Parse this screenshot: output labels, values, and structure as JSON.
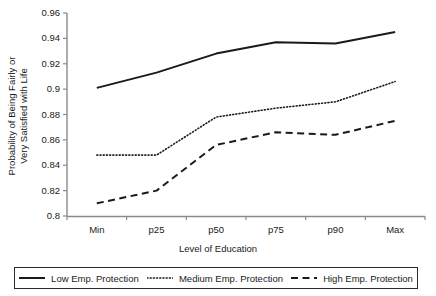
{
  "chart_data": {
    "type": "line",
    "title": "",
    "subtitle": "",
    "xlabel": "Level of Education",
    "ylabel": "Probability of Being Fairly or Very Satisfied with Life",
    "ylabel_line1": "Probability of Being Fairly or",
    "ylabel_line2": "Very Satisfied with Life",
    "categories": [
      "Min",
      "p25",
      "p50",
      "p75",
      "p90",
      "Max"
    ],
    "ylim": [
      0.8,
      0.96
    ],
    "yticks": [
      "0.8",
      "0.82",
      "0.84",
      "0.86",
      "0.88",
      "0.9",
      "0.92",
      "0.94",
      "0.96"
    ],
    "ytick_values": [
      0.8,
      0.82,
      0.84,
      0.86,
      0.88,
      0.9,
      0.92,
      0.94,
      0.96
    ],
    "grid": false,
    "legend_position": "bottom",
    "series": [
      {
        "name": "Low Emp. Protection",
        "style": "solid",
        "color": "#1a1a1a",
        "values": [
          0.901,
          0.913,
          0.928,
          0.937,
          0.936,
          0.945
        ]
      },
      {
        "name": "Medium Emp. Protection",
        "style": "dotted",
        "color": "#1a1a1a",
        "values": [
          0.848,
          0.848,
          0.878,
          0.885,
          0.89,
          0.906
        ]
      },
      {
        "name": "High Emp. Protection",
        "style": "dashed",
        "color": "#1a1a1a",
        "values": [
          0.81,
          0.82,
          0.856,
          0.866,
          0.864,
          0.875
        ]
      }
    ]
  },
  "axis": {
    "x_title": "Level of Education",
    "y_title_line1": "Probability of Being Fairly or",
    "y_title_line2": "Very Satisfied with Life"
  },
  "legend": {
    "items": [
      {
        "label": "Low Emp. Protection",
        "style": "solid"
      },
      {
        "label": "Medium Emp. Protection",
        "style": "dotted"
      },
      {
        "label": "High Emp. Protection",
        "style": "dashed"
      }
    ]
  },
  "colors": {
    "axis": "#808080",
    "line": "#1a1a1a",
    "text": "#1a1a1a",
    "background": "#ffffff"
  }
}
